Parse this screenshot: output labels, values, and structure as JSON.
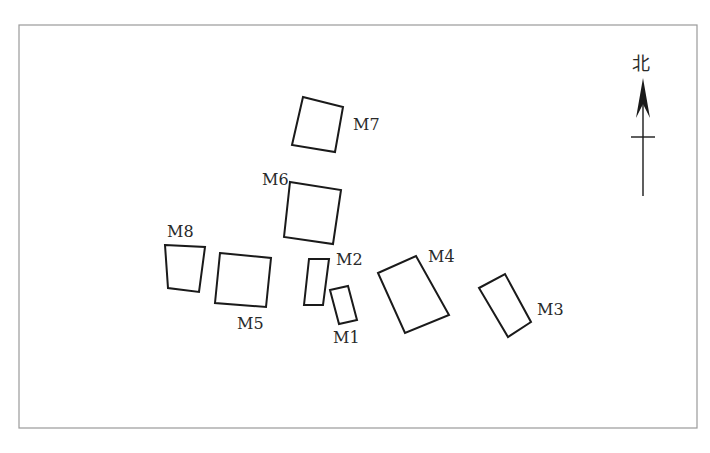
{
  "diagram": {
    "frame": {
      "x": 19,
      "y": 25,
      "width": 678,
      "height": 403,
      "color": "#9a9a9a"
    },
    "north_arrow": {
      "label": "北",
      "label_x": 632,
      "label_y": 70,
      "tip": [
        643,
        78
      ],
      "tail": [
        643,
        196
      ],
      "crossbar_y": 137,
      "crossbar_half_width": 12
    },
    "tombs": [
      {
        "id": "M1",
        "label": "M1",
        "points": "330,290 348,286 357,320 339,324",
        "label_x": 333,
        "label_y": 343
      },
      {
        "id": "M2",
        "label": "M2",
        "points": "309,259 329,259 323,305 304,305",
        "label_x": 336,
        "label_y": 265
      },
      {
        "id": "M3",
        "label": "M3",
        "points": "479,288 505,274 531,322 508,337",
        "label_x": 537,
        "label_y": 315
      },
      {
        "id": "M4",
        "label": "M4",
        "points": "378,273 416,256 449,315 405,333",
        "label_x": 428,
        "label_y": 262
      },
      {
        "id": "M5",
        "label": "M5",
        "points": "220,253 271,258 266,307 215,303",
        "label_x": 237,
        "label_y": 329
      },
      {
        "id": "M6",
        "label": "M6",
        "points": "290,182 341,190 333,244 284,237",
        "label_x": 262,
        "label_y": 185
      },
      {
        "id": "M7",
        "label": "M7",
        "points": "303,97 343,107 335,152 292,145",
        "label_x": 353,
        "label_y": 130
      },
      {
        "id": "M8",
        "label": "M8",
        "points": "165,245 205,247 199,292 168,288",
        "label_x": 167,
        "label_y": 237
      }
    ]
  }
}
